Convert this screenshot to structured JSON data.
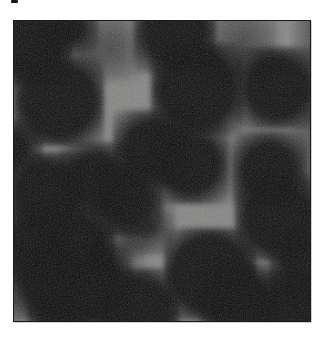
{
  "figure": {
    "type": "micrograph-photo",
    "visible_text": ""
  },
  "colors": {
    "page_background": "#fefefe",
    "photo_background": "#848483",
    "cell_dark": "#0a0a0a",
    "frame_border": "#1a1a1a",
    "crop_mark": "#141414"
  },
  "photo": {
    "left": 13,
    "top": 20,
    "width": 298,
    "height": 302
  },
  "crop_mark": {
    "x": 11,
    "y": 0,
    "width": 7,
    "height": 3
  },
  "vignettes": [
    {
      "side": "right",
      "width": 22,
      "strength": 0.42
    },
    {
      "side": "left",
      "width": 12,
      "strength": 0.2
    }
  ],
  "blobs": [
    {
      "cx": 18,
      "cy": 25,
      "r": 30,
      "shade": "dark"
    },
    {
      "cx": 55,
      "cy": 7,
      "r": 19,
      "shade": "dark"
    },
    {
      "cx": 161,
      "cy": 11,
      "r": 31,
      "shade": "dark"
    },
    {
      "cx": 45,
      "cy": 80,
      "r": 35,
      "shade": "dark"
    },
    {
      "cx": 183,
      "cy": 68,
      "r": 36,
      "shade": "dark"
    },
    {
      "cx": 263,
      "cy": 67,
      "r": 31,
      "shade": "dark"
    },
    {
      "cx": 1,
      "cy": 127,
      "r": 18,
      "shade": "dark"
    },
    {
      "cx": 137,
      "cy": 127,
      "r": 28,
      "shade": "dark"
    },
    {
      "cx": 176,
      "cy": 143,
      "r": 30,
      "shade": "dark"
    },
    {
      "cx": 255,
      "cy": 148,
      "r": 28,
      "shade": "dark"
    },
    {
      "cx": 264,
      "cy": 197,
      "r": 33,
      "shade": "dark"
    },
    {
      "cx": 112,
      "cy": 178,
      "r": 27,
      "shade": "dark"
    },
    {
      "cx": 32,
      "cy": 172,
      "r": 31,
      "shade": "dark"
    },
    {
      "cx": 82,
      "cy": 158,
      "r": 27,
      "shade": "dark"
    },
    {
      "cx": 22,
      "cy": 225,
      "r": 28,
      "shade": "dark"
    },
    {
      "cx": 62,
      "cy": 223,
      "r": 29,
      "shade": "dark"
    },
    {
      "cx": 33,
      "cy": 262,
      "r": 27,
      "shade": "dark"
    },
    {
      "cx": 77,
      "cy": 265,
      "r": 31,
      "shade": "dark"
    },
    {
      "cx": 47,
      "cy": 294,
      "r": 24,
      "shade": "dark"
    },
    {
      "cx": 123,
      "cy": 290,
      "r": 33,
      "shade": "dark"
    },
    {
      "cx": 196,
      "cy": 253,
      "r": 36,
      "shade": "dark"
    },
    {
      "cx": 226,
      "cy": 282,
      "r": 30,
      "shade": "dark"
    },
    {
      "cx": 281,
      "cy": 290,
      "r": 30,
      "shade": "dark"
    },
    {
      "cx": 290,
      "cy": 245,
      "r": 25,
      "shade": "dark"
    },
    {
      "cx": 134,
      "cy": 207,
      "r": 17,
      "shade": "medium"
    },
    {
      "cx": 95,
      "cy": 27,
      "r": 21,
      "shade": "faint"
    },
    {
      "cx": 228,
      "cy": 22,
      "r": 24,
      "shade": "faint"
    },
    {
      "cx": 105,
      "cy": 226,
      "r": 15,
      "shade": "faint"
    }
  ]
}
